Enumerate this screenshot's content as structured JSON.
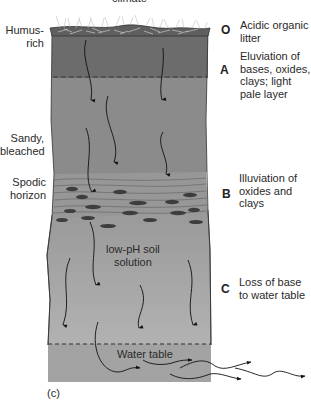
{
  "diagram": {
    "top_caption": "climate",
    "panel_label": "(c)",
    "left_labels": {
      "humus": "Humus-\nrich",
      "humus_line1": "Humus-",
      "humus_line2": "rich",
      "sandy_line1": "Sandy,",
      "sandy_line2": "bleached",
      "spodic_line1": "Spodic",
      "spodic_line2": "horizon"
    },
    "horizons": [
      {
        "letter": "O",
        "lines": [
          "Acidic organic",
          "litter"
        ]
      },
      {
        "letter": "A",
        "lines": [
          "Eluviation of",
          "bases, oxides,",
          "clays; light",
          "pale layer"
        ]
      },
      {
        "letter": "B",
        "lines": [
          "Illuviation of",
          "oxides and",
          "clays"
        ]
      },
      {
        "letter": "C",
        "lines": [
          "Loss of base",
          "to water table"
        ]
      }
    ],
    "inner_labels": {
      "solution_line1": "low-pH soil",
      "solution_line2": "solution",
      "water_table": "Water table"
    },
    "colors": {
      "litter": "#7a7a7a",
      "a_horizon": "#6f6f6f",
      "eluvial": "#8d8d8d",
      "b_horizon": "#959595",
      "c_horizon": "#a9a9a9",
      "water": "#a0a0a0",
      "nodules": "#3e3e3e"
    }
  }
}
